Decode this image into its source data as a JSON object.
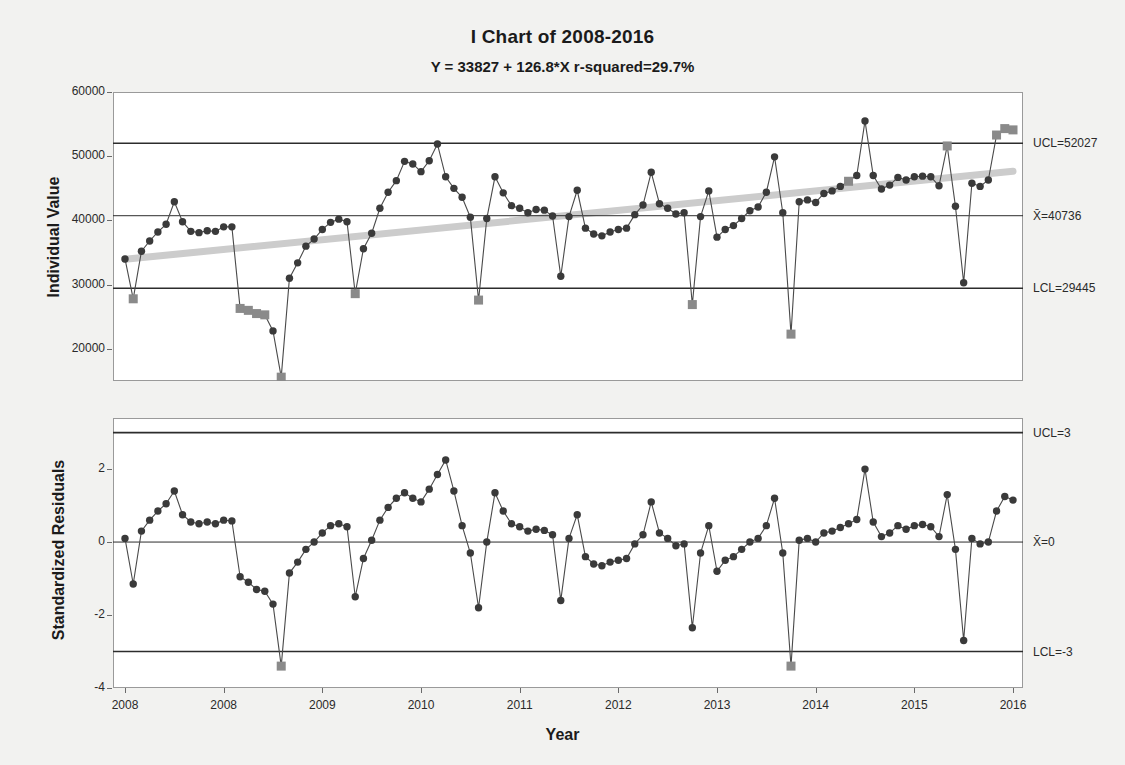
{
  "chart_data": [
    {
      "id": "i-chart",
      "type": "line",
      "title": "I Chart of 2008-2016",
      "subtitle": "Y = 33827 + 126.8*X   r-squared=29.7%",
      "xlabel": "Year",
      "ylabel": "Individual Value",
      "ylim": [
        15000,
        60000
      ],
      "yticks": [
        20000,
        30000,
        40000,
        50000,
        60000
      ],
      "ytick_labels": [
        "20000",
        "30000",
        "40000",
        "50000",
        "60000"
      ],
      "xlim": [
        0,
        107
      ],
      "xticks": [
        0,
        12,
        24,
        36,
        48,
        60,
        72,
        84,
        96
      ],
      "xtick_labels": [
        "2008",
        "2008",
        "2009",
        "2010",
        "2011",
        "2012",
        "2013",
        "2014",
        "2015",
        "2016"
      ],
      "grid": false,
      "legend": "none",
      "center_line": 40736,
      "upper_control_limit": 52027,
      "lower_control_limit": 29445,
      "limit_labels": {
        "ucl": "UCL=52027",
        "center": "X̄=40736",
        "lcl": "LCL=29445"
      },
      "trend": {
        "intercept": 33827,
        "slope": 126.8,
        "r_squared_pct": 29.7,
        "color": "#cccccc"
      },
      "marker_color": "#3a3a3a",
      "violation_marker_color": "#8a8a8a",
      "violation_flag_label": "1",
      "values": [
        34000,
        27800,
        35200,
        36800,
        38200,
        39400,
        42900,
        39800,
        38300,
        38100,
        38400,
        38300,
        39000,
        39000,
        26300,
        26000,
        25500,
        25300,
        22800,
        15600,
        31000,
        33400,
        36000,
        37100,
        38600,
        39700,
        40200,
        39800,
        28600,
        35600,
        38000,
        41900,
        44400,
        46200,
        49200,
        48800,
        47600,
        49300,
        51900,
        46800,
        45000,
        43600,
        40500,
        27600,
        40300,
        46800,
        44300,
        42300,
        41900,
        41200,
        41700,
        41600,
        40700,
        31300,
        40600,
        44700,
        38800,
        37900,
        37600,
        38200,
        38600,
        38800,
        40900,
        42400,
        47500,
        42600,
        41900,
        41000,
        41200,
        26900,
        40600,
        44600,
        37400,
        38600,
        39200,
        40300,
        41500,
        42100,
        44400,
        49900,
        41200,
        22300,
        42900,
        43200,
        42800,
        44200,
        44600,
        45300,
        46100,
        47000,
        55500,
        47000,
        44900,
        45500,
        46700,
        46300,
        46800,
        46900,
        46800,
        45400,
        51600,
        42200,
        30300,
        45800,
        45300,
        46300,
        53300,
        54300,
        54100
      ],
      "violations": [
        {
          "index": 1,
          "value": 27800
        },
        {
          "index": 14,
          "value": 26300
        },
        {
          "index": 15,
          "value": 26000
        },
        {
          "index": 16,
          "value": 25500
        },
        {
          "index": 17,
          "value": 25300
        },
        {
          "index": 19,
          "value": 15600
        },
        {
          "index": 28,
          "value": 28600
        },
        {
          "index": 43,
          "value": 27600
        },
        {
          "index": 69,
          "value": 26900
        },
        {
          "index": 81,
          "value": 22300
        },
        {
          "index": 88,
          "value": 55500
        },
        {
          "index": 100,
          "value": 51600
        },
        {
          "index": 106,
          "value": 53300
        },
        {
          "index": 107,
          "value": 54300
        },
        {
          "index": 108,
          "value": 54100
        }
      ],
      "flagged_above": [
        88,
        100,
        106,
        107,
        108
      ]
    },
    {
      "id": "residual-chart",
      "type": "line",
      "title": "",
      "xlabel": "Year",
      "ylabel": "Standardized Residuals",
      "ylim": [
        -4,
        3.4
      ],
      "yticks": [
        -4,
        -2,
        0,
        2
      ],
      "ytick_labels": [
        "-4",
        "-2",
        "0",
        "2"
      ],
      "grid": false,
      "legend": "none",
      "center_line": 0,
      "upper_control_limit": 3,
      "lower_control_limit": -3,
      "limit_labels": {
        "ucl": "UCL=3",
        "center": "X̄=0",
        "lcl": "LCL=-3"
      },
      "marker_color": "#3a3a3a",
      "violation_marker_color": "#8a8a8a",
      "values": [
        0.1,
        -1.15,
        0.3,
        0.6,
        0.85,
        1.05,
        1.4,
        0.75,
        0.55,
        0.5,
        0.55,
        0.5,
        0.6,
        0.58,
        -0.95,
        -1.1,
        -1.3,
        -1.35,
        -1.7,
        -3.4,
        -0.85,
        -0.55,
        -0.2,
        0.0,
        0.25,
        0.45,
        0.5,
        0.42,
        -1.5,
        -0.45,
        0.05,
        0.6,
        0.95,
        1.2,
        1.35,
        1.2,
        1.1,
        1.45,
        1.85,
        2.25,
        1.4,
        0.45,
        -0.3,
        -1.8,
        0.0,
        1.35,
        0.85,
        0.5,
        0.42,
        0.3,
        0.35,
        0.32,
        0.2,
        -1.6,
        0.1,
        0.75,
        -0.4,
        -0.6,
        -0.65,
        -0.55,
        -0.5,
        -0.45,
        -0.05,
        0.2,
        1.1,
        0.25,
        0.1,
        -0.1,
        -0.05,
        -2.35,
        -0.3,
        0.45,
        -0.8,
        -0.5,
        -0.4,
        -0.2,
        0.0,
        0.1,
        0.45,
        1.2,
        -0.3,
        -3.4,
        0.05,
        0.1,
        0.0,
        0.25,
        0.3,
        0.4,
        0.5,
        0.62,
        2.0,
        0.55,
        0.15,
        0.25,
        0.45,
        0.35,
        0.45,
        0.48,
        0.42,
        0.15,
        1.3,
        -0.2,
        -2.7,
        0.1,
        -0.05,
        0.0,
        0.85,
        1.25,
        1.15
      ],
      "violations": [
        {
          "index": 19,
          "value": -3.4
        },
        {
          "index": 81,
          "value": -3.4
        }
      ]
    }
  ]
}
